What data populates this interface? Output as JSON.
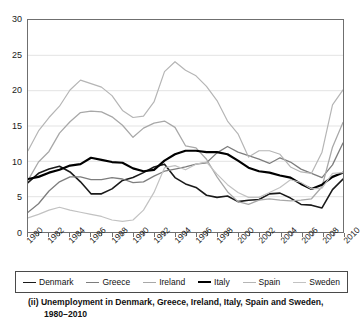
{
  "caption": {
    "line1": "(ii) Unemployment in Denmark, Greece, Ireland, Italy, Spain and Sweden,",
    "line2": "1980–2010"
  },
  "legend": {
    "position": "bottom",
    "items": [
      {
        "label": "Denmark",
        "color": "#1a1a1a",
        "width": 1.6
      },
      {
        "label": "Greece",
        "color": "#7d7d7d",
        "width": 1.3
      },
      {
        "label": "Ireland",
        "color": "#a8a8a8",
        "width": 1.3
      },
      {
        "label": "Italy",
        "color": "#000000",
        "width": 2.2
      },
      {
        "label": "Spain",
        "color": "#b5b5b5",
        "width": 1.2
      },
      {
        "label": "Sweden",
        "color": "#c2c2c2",
        "width": 1.2
      }
    ]
  },
  "axes": {
    "y_ticks": [
      0,
      5,
      10,
      15,
      20,
      25,
      30
    ],
    "x_ticks": [
      1980,
      1982,
      1984,
      1986,
      1988,
      1990,
      1992,
      1994,
      1996,
      1998,
      2000,
      2002,
      2004,
      2006,
      2008,
      2010
    ],
    "x_minor_step": 1,
    "grid_color": "#e3e3e3",
    "frame_color": "#6f6f6f"
  },
  "chart_data": {
    "type": "line",
    "title": "(ii) Unemployment in Denmark, Greece, Ireland, Italy, Spain and Sweden, 1980–2010",
    "xlabel": "",
    "ylabel": "",
    "xlim": [
      1980,
      2010
    ],
    "ylim": [
      0,
      30
    ],
    "grid": true,
    "legend_position": "bottom",
    "x": [
      1980,
      1981,
      1982,
      1983,
      1984,
      1985,
      1986,
      1987,
      1988,
      1989,
      1990,
      1991,
      1992,
      1993,
      1994,
      1995,
      1996,
      1997,
      1998,
      1999,
      2000,
      2001,
      2002,
      2003,
      2004,
      2005,
      2006,
      2007,
      2008,
      2009,
      2010
    ],
    "series": [
      {
        "name": "Denmark",
        "color": "#1a1a1a",
        "width": 1.6,
        "values": [
          7.0,
          8.3,
          8.9,
          9.3,
          8.5,
          7.1,
          5.4,
          5.4,
          6.1,
          7.3,
          7.7,
          8.4,
          9.2,
          9.6,
          7.7,
          6.8,
          6.3,
          5.2,
          4.9,
          5.1,
          4.3,
          4.5,
          4.6,
          5.4,
          5.5,
          4.8,
          3.9,
          3.8,
          3.4,
          6.0,
          7.5
        ]
      },
      {
        "name": "Greece",
        "color": "#7d7d7d",
        "width": 1.3,
        "values": [
          2.8,
          4.0,
          5.8,
          7.1,
          7.8,
          7.8,
          7.4,
          7.4,
          7.7,
          7.5,
          7.0,
          7.1,
          7.9,
          8.6,
          8.9,
          9.2,
          9.6,
          9.8,
          11.2,
          12.1,
          11.3,
          10.8,
          10.3,
          9.7,
          10.5,
          9.9,
          8.9,
          8.3,
          7.7,
          9.5,
          12.6
        ]
      },
      {
        "name": "Ireland",
        "color": "#a8a8a8",
        "width": 1.3,
        "values": [
          7.3,
          9.9,
          11.4,
          14.0,
          15.6,
          16.9,
          17.1,
          17.0,
          16.3,
          15.1,
          13.4,
          14.7,
          15.4,
          15.7,
          14.8,
          12.2,
          11.9,
          10.3,
          7.8,
          5.7,
          4.3,
          3.9,
          4.5,
          4.7,
          4.5,
          4.4,
          4.5,
          4.7,
          6.4,
          12.0,
          15.5
        ]
      },
      {
        "name": "Italy",
        "color": "#000000",
        "width": 2.2,
        "values": [
          7.5,
          7.8,
          8.4,
          8.8,
          9.4,
          9.6,
          10.5,
          10.2,
          9.9,
          9.8,
          9.0,
          8.6,
          8.8,
          10.1,
          11.0,
          11.5,
          11.5,
          11.3,
          11.3,
          11.0,
          10.1,
          9.1,
          8.6,
          8.4,
          8.0,
          7.7,
          6.8,
          6.1,
          6.7,
          7.8,
          8.4
        ]
      },
      {
        "name": "Spain",
        "color": "#b5b5b5",
        "width": 1.2,
        "values": [
          11.5,
          14.3,
          16.2,
          17.8,
          20.1,
          21.5,
          21.0,
          20.5,
          19.3,
          17.2,
          16.2,
          16.4,
          18.4,
          22.7,
          24.1,
          22.9,
          22.1,
          20.6,
          18.6,
          15.7,
          13.9,
          10.6,
          11.5,
          11.5,
          11.0,
          9.2,
          8.5,
          8.3,
          11.3,
          18.0,
          20.1
        ]
      },
      {
        "name": "Sweden",
        "color": "#c2c2c2",
        "width": 1.2,
        "values": [
          2.0,
          2.5,
          3.1,
          3.5,
          3.1,
          2.8,
          2.5,
          2.2,
          1.7,
          1.5,
          1.7,
          3.1,
          5.6,
          9.1,
          9.4,
          8.8,
          9.6,
          9.9,
          8.2,
          6.7,
          5.6,
          4.9,
          4.9,
          5.6,
          6.3,
          7.4,
          7.0,
          6.1,
          6.2,
          8.3,
          8.4
        ]
      }
    ]
  }
}
